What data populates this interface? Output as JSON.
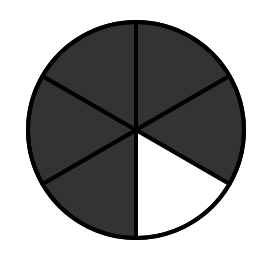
{
  "diagram": {
    "type": "fraction-circle",
    "total_parts": 6,
    "shaded_parts": 5,
    "unshaded_parts": 1,
    "fraction_shaded": "5/6",
    "center": [
      136,
      130
    ],
    "radius": 108,
    "colors": {
      "shaded": "#333333",
      "unshaded": "#ffffff",
      "stroke": "#000000",
      "background": "#ffffff"
    },
    "sectors": [
      {
        "index": 0,
        "start_deg": -90,
        "end_deg": -30,
        "shaded": true
      },
      {
        "index": 1,
        "start_deg": -30,
        "end_deg": 30,
        "shaded": true
      },
      {
        "index": 2,
        "start_deg": 30,
        "end_deg": 90,
        "shaded": false
      },
      {
        "index": 3,
        "start_deg": 90,
        "end_deg": 150,
        "shaded": true
      },
      {
        "index": 4,
        "start_deg": 150,
        "end_deg": 210,
        "shaded": true
      },
      {
        "index": 5,
        "start_deg": 210,
        "end_deg": 270,
        "shaded": true
      }
    ]
  }
}
